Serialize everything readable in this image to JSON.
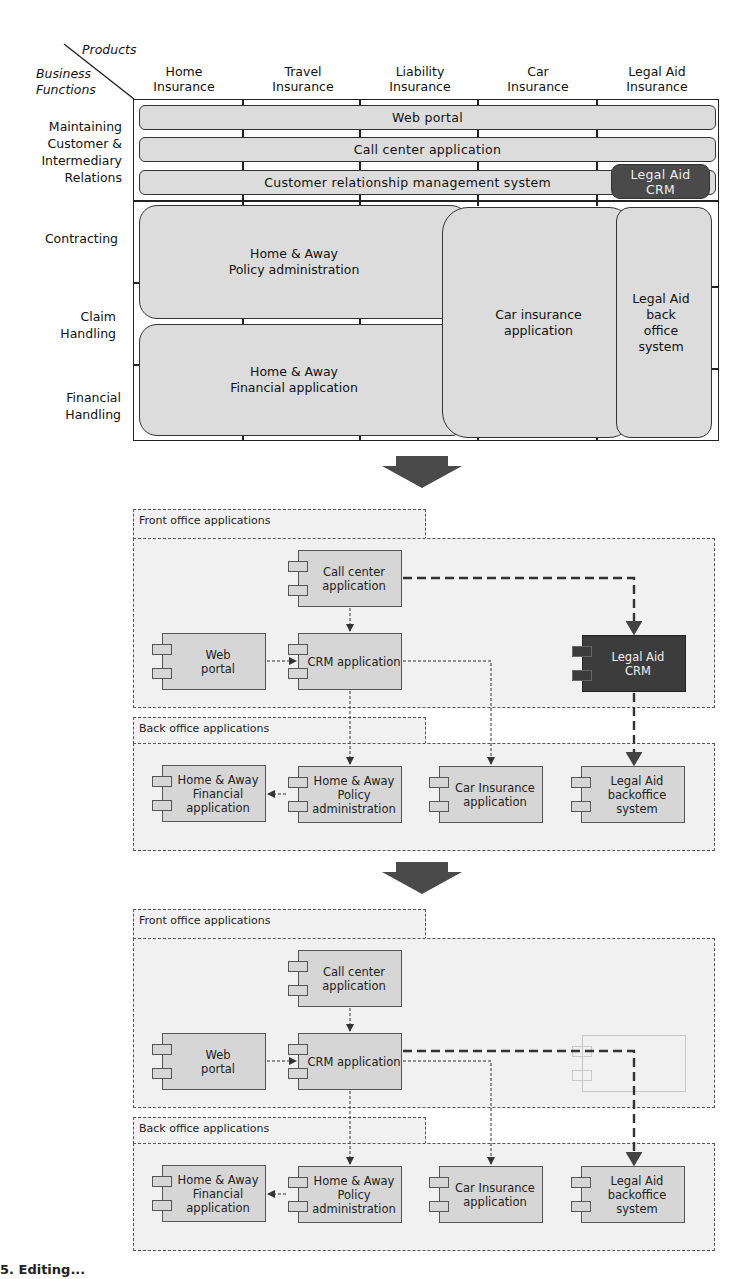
{
  "matrix": {
    "corner": {
      "products_label": "Products",
      "business_functions_label": "Business Functions"
    },
    "products": [
      {
        "line1": "Home",
        "line2": "Insurance"
      },
      {
        "line1": "Travel",
        "line2": "Insurance"
      },
      {
        "line1": "Liability",
        "line2": "Insurance"
      },
      {
        "line1": "Car",
        "line2": "Insurance"
      },
      {
        "line1": "Legal Aid",
        "line2": "Insurance"
      }
    ],
    "business_functions": [
      {
        "lines": [
          "Maintaining",
          "Customer &",
          "Intermediary",
          "Relations"
        ]
      },
      {
        "lines": [
          "Contracting"
        ]
      },
      {
        "lines": [
          "Claim",
          "Handling"
        ]
      },
      {
        "lines": [
          "Financial",
          "Handling"
        ]
      }
    ],
    "applications": {
      "web_portal": "Web portal",
      "call_center": "Call center application",
      "crm_system": "Customer relationship management system",
      "legal_aid_crm": {
        "line1": "Legal Aid",
        "line2": "CRM"
      },
      "home_away_policy": {
        "line1": "Home & Away",
        "line2": "Policy administration"
      },
      "home_away_financial": {
        "line1": "Home & Away",
        "line2": "Financial application"
      },
      "car_insurance": {
        "line1": "Car insurance",
        "line2": "application"
      },
      "legal_aid_back_office": {
        "line1": "Legal Aid",
        "line2": "back",
        "line3": "office",
        "line4": "system"
      }
    },
    "colors": {
      "app_fill": "#dcdcdc",
      "highlight_fill": "#4a4a4a",
      "line": "#222222"
    }
  },
  "diagram_before": {
    "front_office_label": "Front office applications",
    "back_office_label": "Back office applications",
    "components": {
      "call_center": {
        "line1": "Call center",
        "line2": "application"
      },
      "web_portal": {
        "line1": "Web",
        "line2": "portal"
      },
      "crm": {
        "line1": "CRM application"
      },
      "legal_aid_crm": {
        "line1": "Legal Aid",
        "line2": "CRM"
      },
      "home_away_financial": {
        "line1": "Home & Away",
        "line2": "Financial",
        "line3": "application"
      },
      "home_away_policy": {
        "line1": "Home & Away",
        "line2": "Policy",
        "line3": "administration"
      },
      "car_insurance": {
        "line1": "Car Insurance",
        "line2": "application"
      },
      "legal_aid_backoffice": {
        "line1": "Legal Aid",
        "line2": "backoffice",
        "line3": "system"
      }
    }
  },
  "diagram_after": {
    "front_office_label": "Front office applications",
    "back_office_label": "Back office applications",
    "components": {
      "call_center": {
        "line1": "Call center",
        "line2": "application"
      },
      "web_portal": {
        "line1": "Web",
        "line2": "portal"
      },
      "crm": {
        "line1": "CRM application"
      },
      "home_away_financial": {
        "line1": "Home & Away",
        "line2": "Financial",
        "line3": "application"
      },
      "home_away_policy": {
        "line1": "Home & Away",
        "line2": "Policy",
        "line3": "administration"
      },
      "car_insurance": {
        "line1": "Car Insurance",
        "line2": "application"
      },
      "legal_aid_backoffice": {
        "line1": "Legal Aid",
        "line2": "backoffice",
        "line3": "system"
      }
    }
  },
  "caption": {
    "text": "5. Editing..."
  }
}
